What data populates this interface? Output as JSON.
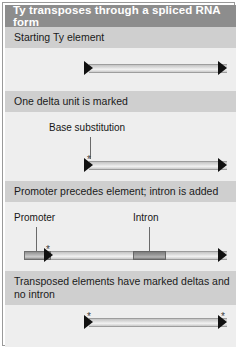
{
  "figure": {
    "title": "Ty transposes through a spliced RNA form",
    "colors": {
      "title_bar": "#8d8d8d",
      "section_header": "#cfcfcf",
      "panel_body": "#eeeeee",
      "element_bar": "#dcdcdc",
      "promoter_block": "#b4b4b4",
      "intron_block": "#9b9b9b",
      "delta_triangle": "#111111",
      "frame": "#9a9a9a"
    },
    "panels": [
      {
        "id": "starting-ty-element",
        "header": "Starting Ty element",
        "labels": [],
        "markers": []
      },
      {
        "id": "one-delta-unit-is-marked",
        "header": "One delta unit is marked",
        "labels": [
          "Base substitution"
        ],
        "markers": [
          "*"
        ]
      },
      {
        "id": "promoter-precedes-element",
        "header": "Promoter precedes element; intron is added",
        "labels": [
          "Promoter",
          "Intron"
        ],
        "markers": [
          "*"
        ]
      },
      {
        "id": "transposed-elements",
        "header": "Transposed elements have marked deltas and no intron",
        "labels": [],
        "markers": [
          "*",
          "*"
        ]
      }
    ],
    "glyphs": {
      "asterisk": "*"
    }
  }
}
